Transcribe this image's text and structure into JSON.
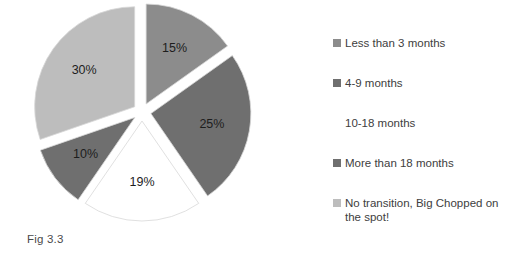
{
  "caption": "Fig 3.3",
  "chart_data": {
    "type": "pie",
    "title": "",
    "categories": [
      "Less than 3 months",
      "4-9 months",
      "10-18 months",
      "More than 18 months",
      "No transition, Big Chopped on the spot!"
    ],
    "values": [
      15,
      25,
      19,
      10,
      30
    ],
    "value_labels": [
      "15%",
      "25%",
      "19%",
      "10%",
      "30%"
    ],
    "colors": [
      "#8c8c8c",
      "#6f6f6f",
      "#ffffff",
      "#6f6f6f",
      "#bdbdbd"
    ],
    "slice_outline": "#d8d8d8",
    "exploded": true,
    "start_angle_deg": 0,
    "direction": "clockwise",
    "legend_position": "right",
    "grid": false,
    "xlabel": "",
    "ylabel": ""
  },
  "legend": {
    "items": [
      {
        "label": "Less than 3 months",
        "color": "#8c8c8c"
      },
      {
        "label": "4-9 months",
        "color": "#6f6f6f"
      },
      {
        "label": "10-18 months",
        "color": "#ffffff"
      },
      {
        "label": "More than 18 months",
        "color": "#6f6f6f"
      },
      {
        "label": "No transition, Big Chopped on\nthe spot!",
        "color": "#bdbdbd"
      }
    ]
  }
}
